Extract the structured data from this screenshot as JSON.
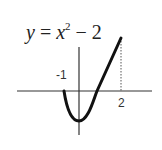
{
  "figure": {
    "equation": {
      "lhs": "y",
      "equals": " = ",
      "base": "x",
      "exponent": "2",
      "rest": " − 2"
    },
    "labels": {
      "left_tick": "-1",
      "right_tick": "2"
    },
    "colors": {
      "curve": "#111111",
      "axes": "#333333",
      "dotted": "#555555"
    }
  }
}
